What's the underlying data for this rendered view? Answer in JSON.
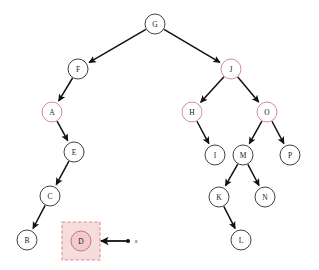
{
  "diagram": {
    "type": "binary-search-tree",
    "canvas": {
      "width": 319,
      "height": 270,
      "background": "#ffffff"
    },
    "colors": {
      "node_stroke": "#2b2b2b",
      "node_fill": "#ffffff",
      "edge": "#111111",
      "accent_stroke": "#d98f93",
      "highlight_fill": "#f6dcdc",
      "highlight_border": "#d78e8e",
      "highlight_node_fill": "#f2cccc",
      "highlight_node_stroke": "#c07b7f",
      "label": "#1a1a1a"
    },
    "node_radius": 10,
    "nodes": [
      {
        "id": "G",
        "label": "G",
        "x": 155,
        "y": 24,
        "accent": false,
        "highlighted": false
      },
      {
        "id": "F",
        "label": "F",
        "x": 78,
        "y": 69,
        "accent": false,
        "highlighted": false
      },
      {
        "id": "J",
        "label": "J",
        "x": 231,
        "y": 69,
        "accent": true,
        "highlighted": false
      },
      {
        "id": "A",
        "label": "A",
        "x": 52,
        "y": 112,
        "accent": true,
        "highlighted": false
      },
      {
        "id": "H",
        "label": "H",
        "x": 192,
        "y": 112,
        "accent": true,
        "highlighted": false
      },
      {
        "id": "O",
        "label": "O",
        "x": 267,
        "y": 112,
        "accent": true,
        "highlighted": false
      },
      {
        "id": "E",
        "label": "E",
        "x": 74,
        "y": 152,
        "accent": false,
        "highlighted": false
      },
      {
        "id": "I",
        "label": "I",
        "x": 215,
        "y": 155,
        "accent": false,
        "highlighted": false
      },
      {
        "id": "M",
        "label": "M",
        "x": 243,
        "y": 155,
        "accent": false,
        "highlighted": false
      },
      {
        "id": "P",
        "label": "P",
        "x": 290,
        "y": 155,
        "accent": false,
        "highlighted": false
      },
      {
        "id": "C",
        "label": "C",
        "x": 50,
        "y": 196,
        "accent": false,
        "highlighted": false
      },
      {
        "id": "K",
        "label": "K",
        "x": 219,
        "y": 197,
        "accent": false,
        "highlighted": false
      },
      {
        "id": "N",
        "label": "N",
        "x": 265,
        "y": 197,
        "accent": false,
        "highlighted": false
      },
      {
        "id": "B",
        "label": "B",
        "x": 27,
        "y": 240,
        "accent": false,
        "highlighted": false
      },
      {
        "id": "D",
        "label": "D",
        "x": 81,
        "y": 241,
        "accent": false,
        "highlighted": true
      },
      {
        "id": "L",
        "label": "L",
        "x": 241,
        "y": 240,
        "accent": false,
        "highlighted": false
      }
    ],
    "edges": [
      {
        "from": "G",
        "to": "F"
      },
      {
        "from": "G",
        "to": "J"
      },
      {
        "from": "F",
        "to": "A"
      },
      {
        "from": "A",
        "to": "E"
      },
      {
        "from": "E",
        "to": "C"
      },
      {
        "from": "C",
        "to": "B"
      },
      {
        "from": "J",
        "to": "H"
      },
      {
        "from": "J",
        "to": "O"
      },
      {
        "from": "H",
        "to": "I"
      },
      {
        "from": "O",
        "to": "M"
      },
      {
        "from": "O",
        "to": "P"
      },
      {
        "from": "M",
        "to": "K"
      },
      {
        "from": "M",
        "to": "N"
      },
      {
        "from": "K",
        "to": "L"
      }
    ],
    "highlight": {
      "target_node": "D",
      "box": {
        "x": 62,
        "y": 222,
        "width": 38,
        "height": 38
      }
    },
    "pointer": {
      "label": "x",
      "label_x": 136,
      "label_y": 241,
      "dot_x": 128,
      "dot_y": 241,
      "tip_x": 101,
      "tip_y": 241
    }
  }
}
